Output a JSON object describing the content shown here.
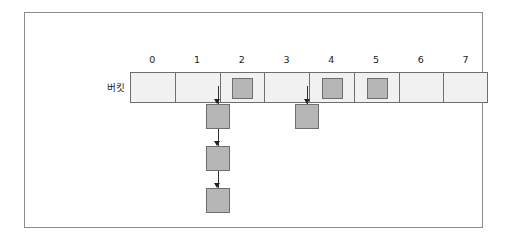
{
  "diagram": {
    "row_label": "버킷",
    "colors": {
      "frame_border": "#8a8a8a",
      "cell_fill": "#f1f1f1",
      "cell_border": "#6e6e6e",
      "node_fill": "#b6b6b6",
      "node_border": "#6e6e6e",
      "connector": "#333333",
      "text": "#1a1a1a",
      "background": "#ffffff"
    },
    "bucket_count": 8,
    "indices": [
      "0",
      "1",
      "2",
      "3",
      "4",
      "5",
      "6",
      "7"
    ],
    "buckets": [
      {
        "index": "0",
        "occupied": false,
        "has_chain": false,
        "chain_length": 0
      },
      {
        "index": "1",
        "occupied": false,
        "has_chain": false,
        "chain_length": 0
      },
      {
        "index": "2",
        "occupied": true,
        "has_chain": true,
        "chain_length": 3
      },
      {
        "index": "3",
        "occupied": false,
        "has_chain": false,
        "chain_length": 0
      },
      {
        "index": "4",
        "occupied": true,
        "has_chain": true,
        "chain_length": 1
      },
      {
        "index": "5",
        "occupied": true,
        "has_chain": false,
        "chain_length": 0
      },
      {
        "index": "6",
        "occupied": false,
        "has_chain": false,
        "chain_length": 0
      },
      {
        "index": "7",
        "occupied": false,
        "has_chain": false,
        "chain_length": 0
      }
    ],
    "chains": [
      {
        "from_index": "2",
        "nodes": [
          "node-2-1",
          "node-2-2",
          "node-2-3"
        ]
      },
      {
        "from_index": "4",
        "nodes": [
          "node-4-1"
        ]
      }
    ]
  },
  "geometry": {
    "array_left": 105,
    "array_top": 59,
    "array_width": 358,
    "cell_height": 31,
    "index_top": 38,
    "slot_size": 21,
    "node_width": 24,
    "node_height": 25,
    "chain_rows_top": [
      103,
      145,
      187
    ]
  }
}
